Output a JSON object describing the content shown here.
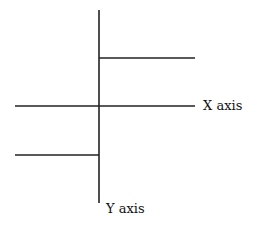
{
  "diagram": {
    "x_axis_label": "X axis",
    "y_axis_label": "Y axis",
    "line_color": "#222222",
    "segments": [
      {
        "name": "y-axis-line",
        "x1": 99,
        "y1": 10,
        "x2": 99,
        "y2": 203
      },
      {
        "name": "x-axis-line",
        "x1": 15,
        "y1": 106,
        "x2": 195,
        "y2": 106
      },
      {
        "name": "upper-step-line",
        "x1": 99,
        "y1": 58,
        "x2": 195,
        "y2": 58
      },
      {
        "name": "lower-step-line",
        "x1": 15,
        "y1": 155,
        "x2": 99,
        "y2": 155
      }
    ]
  }
}
